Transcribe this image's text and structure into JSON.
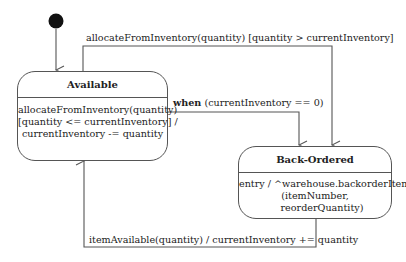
{
  "diagram": {
    "type": "uml-state-machine",
    "initial_state": {
      "target": "Available"
    },
    "states": [
      {
        "name": "Available",
        "internal_transitions": [
          "allocateFromInventory(quantity)",
          "[quantity <= currentInventory] /",
          "currentInventory -= quantity"
        ]
      },
      {
        "name": "Back-Ordered",
        "internal_transitions": [
          "entry / ^warehouse.backorderItem",
          "(itemNumber,",
          "reorderQuantity)"
        ]
      }
    ],
    "transitions": [
      {
        "from": "Available",
        "to": "Back-Ordered",
        "label": "allocateFromInventory(quantity) [quantity > currentInventory]"
      },
      {
        "from": "Available",
        "to": "Back-Ordered",
        "keyword": "when",
        "label": "(currentInventory == 0)"
      },
      {
        "from": "Back-Ordered",
        "to": "Available",
        "label": "itemAvailable(quantity) / currentInventory += quantity"
      }
    ]
  }
}
